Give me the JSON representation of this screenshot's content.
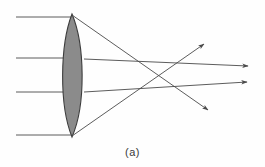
{
  "figure": {
    "caption": "(a)",
    "colors": {
      "lens_fill": "#8b8b8b",
      "lens_stroke": "#3c3c3c",
      "ray_stroke": "#4a4a4a",
      "background": "#fefefe",
      "caption_text": "#3a3a3a"
    },
    "lens": {
      "type": "biconvex-converging",
      "apex_top": {
        "x": 72,
        "y": 14
      },
      "apex_bottom": {
        "x": 72,
        "y": 137
      },
      "half_width": 13,
      "center_x": 72,
      "label": "converging-lens"
    },
    "incident_rays": [
      {
        "name": "incident-ray-1",
        "y": 17,
        "x_start": 16,
        "x_end": 72
      },
      {
        "name": "incident-ray-2",
        "y": 58,
        "x_start": 16,
        "x_end": 78
      },
      {
        "name": "incident-ray-3",
        "y": 92,
        "x_start": 16,
        "x_end": 78
      },
      {
        "name": "incident-ray-4",
        "y": 135,
        "x_start": 16,
        "x_end": 72
      }
    ],
    "refracted_rays": [
      {
        "name": "refracted-ray-1",
        "from": {
          "x": 72,
          "y": 15
        },
        "to": {
          "x": 208,
          "y": 110
        },
        "arrow_tip": {
          "x": 208,
          "y": 110
        }
      },
      {
        "name": "refracted-ray-2",
        "from": {
          "x": 84,
          "y": 59
        },
        "to": {
          "x": 248,
          "y": 66
        },
        "arrow_tip": {
          "x": 248,
          "y": 66
        }
      },
      {
        "name": "refracted-ray-3",
        "from": {
          "x": 84,
          "y": 92
        },
        "to": {
          "x": 247,
          "y": 82
        },
        "arrow_tip": {
          "x": 247,
          "y": 82
        }
      },
      {
        "name": "refracted-ray-4",
        "from": {
          "x": 72,
          "y": 136
        },
        "to": {
          "x": 204,
          "y": 44
        },
        "arrow_tip": {
          "x": 204,
          "y": 44
        }
      }
    ],
    "focal_region": {
      "name": "ray-crossing-region",
      "center": {
        "x": 166,
        "y": 76
      }
    }
  }
}
